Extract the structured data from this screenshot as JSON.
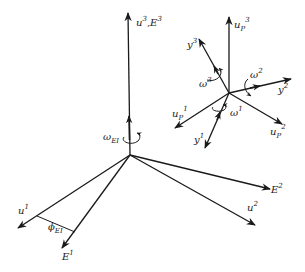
{
  "diagram": {
    "inertial_frame": {
      "origin": [
        130,
        155
      ],
      "axes": [
        {
          "id": "u3",
          "label": "u",
          "sup": "3",
          "extra": ",E",
          "extra_sup": "3",
          "tip": [
            128,
            13
          ]
        },
        {
          "id": "u1",
          "label": "u",
          "sup": "1",
          "tip": [
            18,
            228
          ]
        },
        {
          "id": "E1",
          "label": "E",
          "sup": "1",
          "tip": [
            62,
            248
          ]
        },
        {
          "id": "E2",
          "label": "E",
          "sup": "2",
          "tip": [
            270,
            189
          ]
        },
        {
          "id": "u2",
          "label": "u",
          "sup": "2",
          "tip": [
            255,
            225
          ]
        }
      ],
      "rotation": {
        "label": "ω",
        "sub": "EI"
      },
      "angle": {
        "label": "ϕ",
        "sub": "EI"
      }
    },
    "body_frame": {
      "origin": [
        229,
        93
      ],
      "axes": [
        {
          "id": "uP3",
          "label": "u",
          "sub": "P",
          "sup": "3",
          "tip": [
            229,
            17
          ]
        },
        {
          "id": "uP1",
          "label": "u",
          "sub": "P",
          "sup": "1",
          "tip": [
            175,
            128
          ]
        },
        {
          "id": "uP2",
          "label": "u",
          "sub": "P",
          "sup": "2",
          "tip": [
            282,
            124
          ]
        },
        {
          "id": "y1",
          "label": "y",
          "sup": "1",
          "tip": [
            205,
            148
          ]
        },
        {
          "id": "y2",
          "label": "y",
          "sup": "2",
          "tip": [
            291,
            79
          ]
        },
        {
          "id": "y3",
          "label": "y",
          "sup": "3",
          "tip": [
            199,
            39
          ]
        }
      ],
      "rotations": [
        {
          "label": "ω",
          "sup": "1"
        },
        {
          "label": "ω",
          "sup": "2"
        },
        {
          "label": "ω",
          "sup": "3"
        }
      ]
    }
  }
}
